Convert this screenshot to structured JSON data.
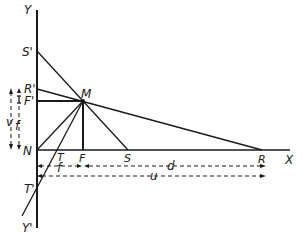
{
  "diagram": {
    "type": "geometric-optics-construction",
    "axes": {
      "y_label": "Y",
      "y_neg_label": "Y'",
      "x_label": "X"
    },
    "points": {
      "origin": "N",
      "M": "M",
      "F": "F",
      "F_prime": "F'",
      "S": "S",
      "S_prime": "S'",
      "R": "R",
      "R_prime": "R'",
      "T": "T",
      "T_prime": "T'"
    },
    "dimensions": {
      "v": "v",
      "f_vertical": "f",
      "f_horizontal": "f",
      "d": "d",
      "u": "u"
    }
  }
}
